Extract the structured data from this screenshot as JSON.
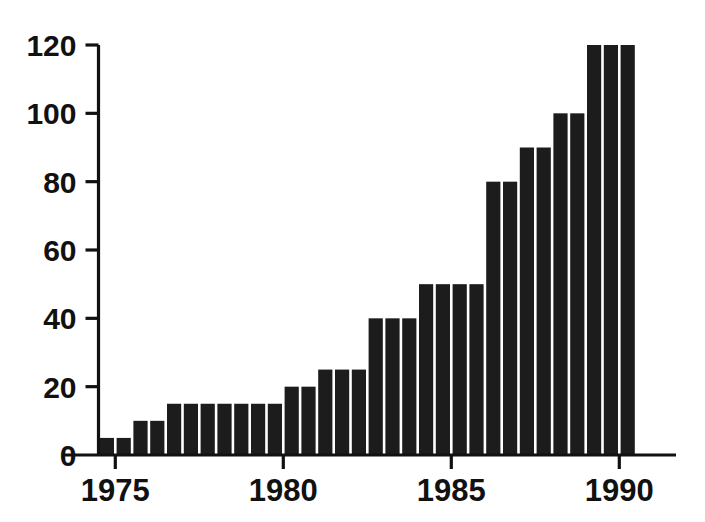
{
  "chart_data": {
    "type": "bar",
    "title": "",
    "subtitle": "",
    "xlabel": "",
    "ylabel": "",
    "xlim": [
      1974.5,
      1991.0
    ],
    "ylim": [
      0,
      120
    ],
    "grid": false,
    "legend": false,
    "bar_color": "#1c1c1c",
    "axis_color": "#111111",
    "background_color": "#ffffff",
    "y_ticks": [
      0,
      20,
      40,
      60,
      80,
      100,
      120
    ],
    "y_tick_labels": [
      "0",
      "20",
      "40",
      "60",
      "80",
      "100",
      "120"
    ],
    "x_ticks": [
      1975,
      1980,
      1985,
      1990
    ],
    "x_tick_labels": [
      "1975",
      "1980",
      "1985",
      "1990"
    ],
    "bar_interval_years": 0.5,
    "x": [
      1974.5,
      1975.0,
      1975.5,
      1976.0,
      1976.5,
      1977.0,
      1977.5,
      1978.0,
      1978.5,
      1979.0,
      1979.5,
      1980.0,
      1980.5,
      1981.0,
      1981.5,
      1982.0,
      1982.5,
      1983.0,
      1983.5,
      1984.0,
      1984.5,
      1985.0,
      1985.5,
      1986.0,
      1986.5,
      1987.0,
      1987.5,
      1988.0,
      1988.5,
      1989.0,
      1989.5,
      1990.0
    ],
    "categories": [
      "1974.5",
      "1975.0",
      "1975.5",
      "1976.0",
      "1976.5",
      "1977.0",
      "1977.5",
      "1978.0",
      "1978.5",
      "1979.0",
      "1979.5",
      "1980.0",
      "1980.5",
      "1981.0",
      "1981.5",
      "1982.0",
      "1982.5",
      "1983.0",
      "1983.5",
      "1984.0",
      "1984.5",
      "1985.0",
      "1985.5",
      "1986.0",
      "1986.5",
      "1987.0",
      "1987.5",
      "1988.0",
      "1988.5",
      "1989.0",
      "1989.5",
      "1990.0"
    ],
    "values": [
      5,
      5,
      10,
      10,
      15,
      15,
      15,
      15,
      15,
      15,
      15,
      20,
      20,
      25,
      25,
      25,
      40,
      40,
      40,
      50,
      50,
      50,
      50,
      80,
      80,
      90,
      90,
      100,
      100,
      120,
      120,
      120
    ]
  }
}
